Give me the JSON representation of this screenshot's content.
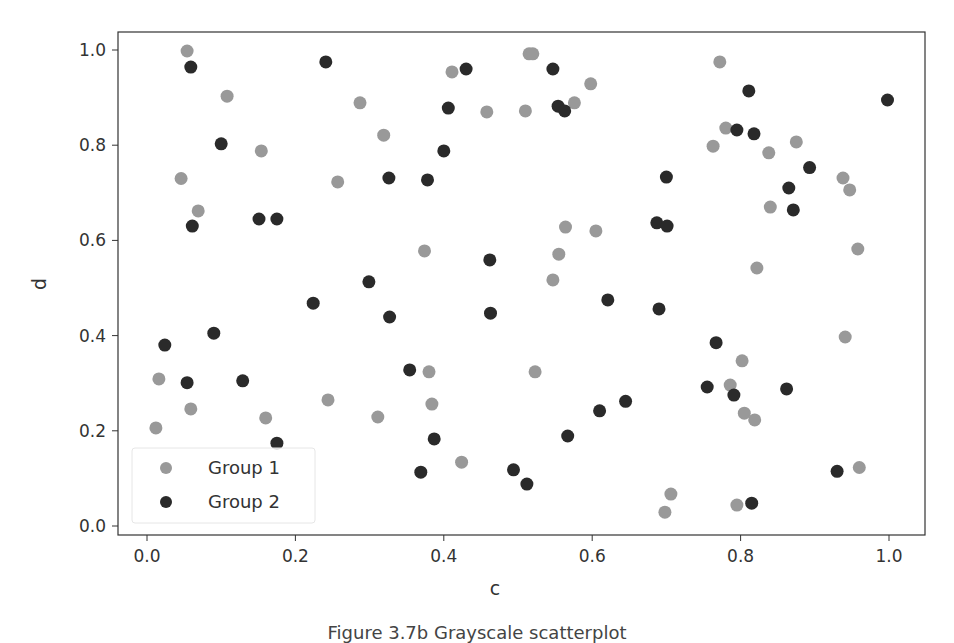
{
  "chart_data": {
    "type": "scatter",
    "title": "",
    "xlabel": "c",
    "ylabel": "d",
    "xlim": [
      -0.04,
      1.04
    ],
    "ylim": [
      -0.02,
      1.04
    ],
    "xticks": [
      "0.0",
      "0.2",
      "0.4",
      "0.6",
      "0.8",
      "1.0"
    ],
    "yticks": [
      "0.0",
      "0.2",
      "0.4",
      "0.6",
      "0.8",
      "1.0"
    ],
    "grid": false,
    "legend_position": "lower left",
    "series": [
      {
        "name": "Group 1",
        "color": "#999999",
        "points": [
          [
            0.012,
            0.206
          ],
          [
            0.016,
            0.309
          ],
          [
            0.046,
            0.73
          ],
          [
            0.054,
            0.998
          ],
          [
            0.059,
            0.246
          ],
          [
            0.069,
            0.662
          ],
          [
            0.108,
            0.903
          ],
          [
            0.154,
            0.788
          ],
          [
            0.16,
            0.227
          ],
          [
            0.257,
            0.723
          ],
          [
            0.244,
            0.265
          ],
          [
            0.287,
            0.889
          ],
          [
            0.311,
            0.229
          ],
          [
            0.319,
            0.821
          ],
          [
            0.374,
            0.578
          ],
          [
            0.38,
            0.324
          ],
          [
            0.384,
            0.256
          ],
          [
            0.411,
            0.954
          ],
          [
            0.424,
            0.134
          ],
          [
            0.458,
            0.87
          ],
          [
            0.51,
            0.872
          ],
          [
            0.515,
            0.992
          ],
          [
            0.52,
            0.992
          ],
          [
            0.523,
            0.324
          ],
          [
            0.547,
            0.517
          ],
          [
            0.555,
            0.571
          ],
          [
            0.564,
            0.628
          ],
          [
            0.576,
            0.889
          ],
          [
            0.598,
            0.929
          ],
          [
            0.605,
            0.62
          ],
          [
            0.698,
            0.029
          ],
          [
            0.706,
            0.067
          ],
          [
            0.763,
            0.798
          ],
          [
            0.772,
            0.975
          ],
          [
            0.78,
            0.836
          ],
          [
            0.786,
            0.296
          ],
          [
            0.795,
            0.044
          ],
          [
            0.802,
            0.347
          ],
          [
            0.805,
            0.237
          ],
          [
            0.819,
            0.223
          ],
          [
            0.822,
            0.542
          ],
          [
            0.838,
            0.784
          ],
          [
            0.84,
            0.67
          ],
          [
            0.875,
            0.807
          ],
          [
            0.938,
            0.731
          ],
          [
            0.947,
            0.706
          ],
          [
            0.941,
            0.397
          ],
          [
            0.958,
            0.582
          ],
          [
            0.96,
            0.123
          ]
        ]
      },
      {
        "name": "Group 2",
        "color": "#2a2a2a",
        "points": [
          [
            0.024,
            0.38
          ],
          [
            0.054,
            0.301
          ],
          [
            0.059,
            0.964
          ],
          [
            0.061,
            0.63
          ],
          [
            0.09,
            0.405
          ],
          [
            0.1,
            0.803
          ],
          [
            0.129,
            0.305
          ],
          [
            0.151,
            0.645
          ],
          [
            0.175,
            0.645
          ],
          [
            0.175,
            0.174
          ],
          [
            0.224,
            0.468
          ],
          [
            0.241,
            0.975
          ],
          [
            0.299,
            0.513
          ],
          [
            0.326,
            0.731
          ],
          [
            0.327,
            0.439
          ],
          [
            0.354,
            0.328
          ],
          [
            0.378,
            0.727
          ],
          [
            0.369,
            0.113
          ],
          [
            0.387,
            0.183
          ],
          [
            0.4,
            0.788
          ],
          [
            0.406,
            0.878
          ],
          [
            0.43,
            0.96
          ],
          [
            0.462,
            0.559
          ],
          [
            0.463,
            0.447
          ],
          [
            0.494,
            0.118
          ],
          [
            0.512,
            0.088
          ],
          [
            0.547,
            0.96
          ],
          [
            0.554,
            0.882
          ],
          [
            0.563,
            0.872
          ],
          [
            0.567,
            0.189
          ],
          [
            0.61,
            0.242
          ],
          [
            0.621,
            0.475
          ],
          [
            0.645,
            0.262
          ],
          [
            0.687,
            0.637
          ],
          [
            0.69,
            0.456
          ],
          [
            0.7,
            0.733
          ],
          [
            0.701,
            0.63
          ],
          [
            0.755,
            0.292
          ],
          [
            0.767,
            0.385
          ],
          [
            0.791,
            0.275
          ],
          [
            0.795,
            0.832
          ],
          [
            0.818,
            0.824
          ],
          [
            0.811,
            0.914
          ],
          [
            0.815,
            0.048
          ],
          [
            0.862,
            0.288
          ],
          [
            0.865,
            0.71
          ],
          [
            0.871,
            0.664
          ],
          [
            0.893,
            0.753
          ],
          [
            0.93,
            0.115
          ],
          [
            0.998,
            0.895
          ]
        ]
      }
    ]
  },
  "caption": "Figure 3.7b Grayscale scatterplot"
}
